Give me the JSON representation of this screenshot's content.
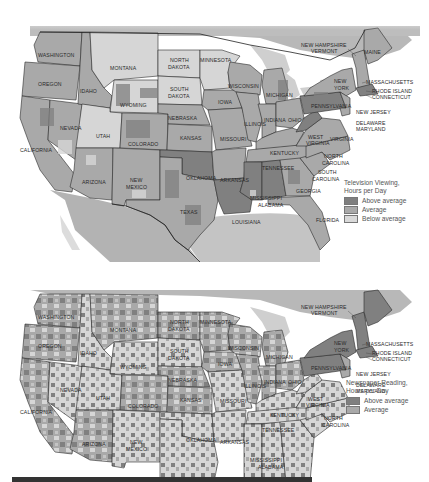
{
  "colors": {
    "above_average": "#7f7f7f",
    "average": "#a9a9a9",
    "below_average": "#d9d9d9",
    "water": "#c8c8c8",
    "border": "#222222",
    "canada_mexico": "#b5b5b5"
  },
  "maps": [
    {
      "id": "tv",
      "legend": {
        "title_line1": "Television Viewing,",
        "title_line2": "Hours per Day",
        "items": [
          {
            "label": "Above average",
            "class": "above_average"
          },
          {
            "label": "Average",
            "class": "average"
          },
          {
            "label": "Below average",
            "class": "below_average"
          }
        ]
      }
    },
    {
      "id": "news",
      "legend": {
        "title_line1": "Newspaper Reading,",
        "title_line2": "Hours per Day",
        "items": [
          {
            "label": "Above average",
            "class": "above_average"
          },
          {
            "label": "Average",
            "class": "average"
          }
        ]
      }
    }
  ],
  "state_labels": {
    "washington": "WASHINGTON",
    "oregon": "OREGON",
    "california": "CALIFORNIA",
    "nevada": "NEVADA",
    "idaho": "IDAHO",
    "montana": "MONTANA",
    "wyoming": "WYOMING",
    "utah": "UTAH",
    "arizona": "ARIZONA",
    "colorado": "COLORADO",
    "new_mexico_1": "NEW",
    "new_mexico_2": "MEXICO",
    "north_dakota_1": "NORTH",
    "north_dakota_2": "DAKOTA",
    "south_dakota_1": "SOUTH",
    "south_dakota_2": "DAKOTA",
    "nebraska": "NEBRASKA",
    "kansas": "KANSAS",
    "oklahoma": "OKLAHOMA",
    "texas": "TEXAS",
    "minnesota": "MINNESOTA",
    "iowa": "IOWA",
    "missouri": "MISSOURI",
    "arkansas": "ARKANSAS",
    "louisiana": "LOUISIANA",
    "wisconsin": "WISCONSIN",
    "illinois": "ILLINOIS",
    "michigan": "MICHIGAN",
    "indiana": "INDIANA",
    "ohio": "OHIO",
    "kentucky": "KENTUCKY",
    "tennessee": "TENNESSEE",
    "mississippi": "MISSISSIPPI",
    "alabama": "ALABAMA",
    "georgia": "GEORGIA",
    "florida": "FLORIDA",
    "south_carolina_1": "SOUTH",
    "south_carolina_2": "CAROLINA",
    "north_carolina_1": "NORTH",
    "north_carolina_2": "CAROLINA",
    "virginia": "VIRGINIA",
    "west_virginia_1": "WEST",
    "west_virginia_2": "VIRGINIA",
    "pennsylvania": "PENNSYLVANIA",
    "new_york_1": "NEW",
    "new_york_2": "YORK",
    "new_jersey": "NEW JERSEY",
    "delaware": "DELAWARE",
    "maryland": "MARYLAND",
    "connecticut": "CONNECTICUT",
    "rhode_island": "RHODE ISLAND",
    "massachusetts": "MASSACHUSETTS",
    "new_hampshire": "NEW HAMPSHIRE",
    "vermont": "VERMONT",
    "maine": "MAINE"
  }
}
